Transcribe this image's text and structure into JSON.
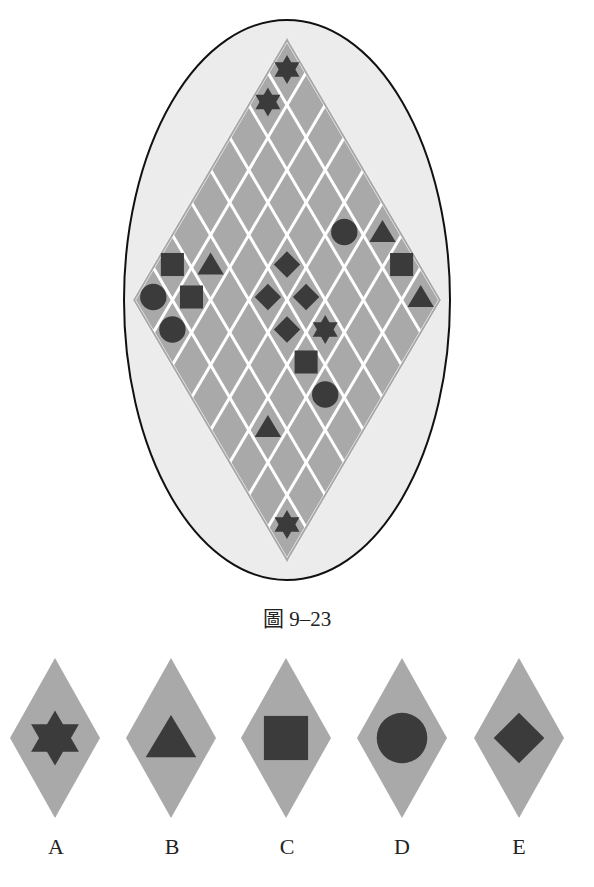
{
  "figure": {
    "caption": "圖 9–23",
    "grid_size": 8,
    "colors": {
      "ellipse_fill": "#ececec",
      "ellipse_stroke": "#111111",
      "cell_fill": "#a9a9a9",
      "grid_line": "#ffffff",
      "symbol": "#3b3b3b"
    },
    "symbols": [
      {
        "row": 0,
        "col": 0,
        "shape": "star"
      },
      {
        "row": 1,
        "col": 0,
        "shape": "star"
      },
      {
        "row": 1,
        "col": 4,
        "shape": "circle"
      },
      {
        "row": 0,
        "col": 5,
        "shape": "triangle"
      },
      {
        "row": 0,
        "col": 6,
        "shape": "square"
      },
      {
        "row": 0,
        "col": 7,
        "shape": "triangle"
      },
      {
        "row": 6,
        "col": 0,
        "shape": "square"
      },
      {
        "row": 5,
        "col": 1,
        "shape": "triangle"
      },
      {
        "row": 7,
        "col": 0,
        "shape": "circle"
      },
      {
        "row": 6,
        "col": 1,
        "shape": "square"
      },
      {
        "row": 7,
        "col": 1,
        "shape": "circle"
      },
      {
        "row": 3,
        "col": 3,
        "shape": "diamond"
      },
      {
        "row": 4,
        "col": 3,
        "shape": "diamond"
      },
      {
        "row": 3,
        "col": 4,
        "shape": "diamond"
      },
      {
        "row": 4,
        "col": 4,
        "shape": "diamond"
      },
      {
        "row": 3,
        "col": 5,
        "shape": "star"
      },
      {
        "row": 4,
        "col": 5,
        "shape": "square"
      },
      {
        "row": 4,
        "col": 6,
        "shape": "circle"
      },
      {
        "row": 6,
        "col": 5,
        "shape": "triangle"
      },
      {
        "row": 7,
        "col": 7,
        "shape": "star"
      }
    ]
  },
  "options": [
    {
      "label": "A",
      "shape": "star"
    },
    {
      "label": "B",
      "shape": "triangle"
    },
    {
      "label": "C",
      "shape": "square"
    },
    {
      "label": "D",
      "shape": "circle"
    },
    {
      "label": "E",
      "shape": "diamond"
    }
  ]
}
